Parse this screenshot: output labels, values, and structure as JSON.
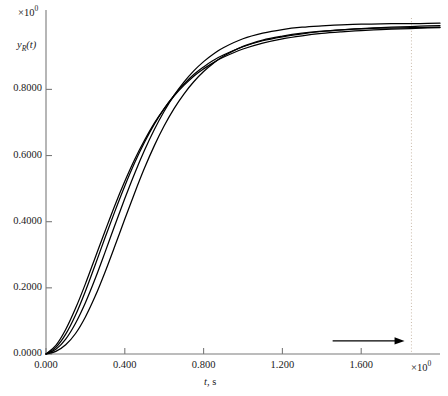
{
  "chart_data": {
    "type": "line",
    "title": "",
    "xlabel": "t, s",
    "ylabel": "y_R(t)",
    "ylabel_base": "y",
    "ylabel_sub": "R",
    "ylabel_arg": "(t)",
    "x_exponent_label": "×10",
    "x_exponent_value": "0",
    "y_exponent_label": "×10",
    "y_exponent_value": "0",
    "xlim": [
      0.0,
      2.0
    ],
    "ylim": [
      0.0,
      1.04
    ],
    "xticks": [
      0.0,
      0.4,
      0.8,
      1.2,
      1.6
    ],
    "xtick_labels": [
      "0.000",
      "0.400",
      "0.800",
      "1.200",
      "1.600"
    ],
    "yticks": [
      0.0,
      0.2,
      0.4,
      0.6,
      0.8
    ],
    "ytick_labels": [
      "0.0000",
      "0.2000",
      "0.4000",
      "0.6000",
      "0.8000"
    ],
    "grid": false,
    "legend": "none",
    "line_color": "#000000",
    "axis_color": "#7a7a7a",
    "annotation_arrow": {
      "label": "arrow-right",
      "x_start": 1.455,
      "x_end": 1.82,
      "y": 0.0395
    },
    "annotation_vline": {
      "label": "dotted-vertical-line",
      "x": 1.855,
      "style": "dotted",
      "color": "#c8b9a8"
    },
    "series": [
      {
        "name": "curve-1",
        "plateau": 1.0,
        "x": [
          0.0,
          0.05,
          0.1,
          0.15,
          0.2,
          0.25,
          0.3,
          0.35,
          0.4,
          0.45,
          0.5,
          0.55,
          0.6,
          0.65,
          0.7,
          0.75,
          0.8,
          0.85,
          0.9,
          1.0,
          1.1,
          1.2,
          1.3,
          1.4,
          1.5,
          1.6,
          1.7,
          1.8,
          1.9,
          2.0
        ],
        "y": [
          0.0,
          0.014,
          0.045,
          0.093,
          0.155,
          0.228,
          0.308,
          0.39,
          0.47,
          0.546,
          0.616,
          0.679,
          0.734,
          0.782,
          0.822,
          0.856,
          0.884,
          0.907,
          0.926,
          0.953,
          0.97,
          0.981,
          0.988,
          0.992,
          0.995,
          0.997,
          0.998,
          0.999,
          0.999,
          1.0
        ]
      },
      {
        "name": "curve-2",
        "plateau": 0.995,
        "x": [
          0.0,
          0.05,
          0.1,
          0.15,
          0.2,
          0.25,
          0.3,
          0.35,
          0.4,
          0.45,
          0.5,
          0.55,
          0.6,
          0.65,
          0.7,
          0.75,
          0.8,
          0.85,
          0.9,
          1.0,
          1.1,
          1.2,
          1.3,
          1.4,
          1.5,
          1.6,
          1.7,
          1.8,
          1.9,
          2.0
        ],
        "y": [
          0.0,
          0.02,
          0.06,
          0.118,
          0.19,
          0.27,
          0.352,
          0.432,
          0.508,
          0.578,
          0.64,
          0.695,
          0.742,
          0.782,
          0.816,
          0.845,
          0.868,
          0.888,
          0.904,
          0.929,
          0.947,
          0.959,
          0.968,
          0.975,
          0.98,
          0.984,
          0.987,
          0.989,
          0.991,
          0.993
        ]
      },
      {
        "name": "curve-3",
        "plateau": 0.99,
        "x": [
          0.0,
          0.05,
          0.1,
          0.15,
          0.2,
          0.25,
          0.3,
          0.35,
          0.4,
          0.45,
          0.5,
          0.55,
          0.6,
          0.65,
          0.7,
          0.75,
          0.8,
          0.85,
          0.9,
          1.0,
          1.1,
          1.2,
          1.3,
          1.4,
          1.5,
          1.6,
          1.7,
          1.8,
          1.9,
          2.0
        ],
        "y": [
          0.0,
          0.026,
          0.074,
          0.138,
          0.212,
          0.292,
          0.372,
          0.45,
          0.522,
          0.588,
          0.646,
          0.698,
          0.742,
          0.78,
          0.812,
          0.84,
          0.862,
          0.881,
          0.897,
          0.922,
          0.94,
          0.953,
          0.962,
          0.969,
          0.974,
          0.978,
          0.981,
          0.983,
          0.985,
          0.987
        ]
      },
      {
        "name": "curve-4",
        "plateau": 0.988,
        "x": [
          0.0,
          0.05,
          0.1,
          0.15,
          0.2,
          0.25,
          0.3,
          0.35,
          0.4,
          0.45,
          0.5,
          0.55,
          0.6,
          0.65,
          0.7,
          0.75,
          0.8,
          0.85,
          0.9,
          1.0,
          1.1,
          1.2,
          1.3,
          1.4,
          1.5,
          1.6,
          1.7,
          1.8,
          1.9,
          2.0
        ],
        "y": [
          0.0,
          0.008,
          0.028,
          0.062,
          0.112,
          0.175,
          0.248,
          0.327,
          0.408,
          0.487,
          0.562,
          0.63,
          0.69,
          0.742,
          0.786,
          0.823,
          0.854,
          0.879,
          0.9,
          0.93,
          0.949,
          0.961,
          0.97,
          0.976,
          0.98,
          0.983,
          0.985,
          0.986,
          0.987,
          0.988
        ]
      }
    ]
  }
}
